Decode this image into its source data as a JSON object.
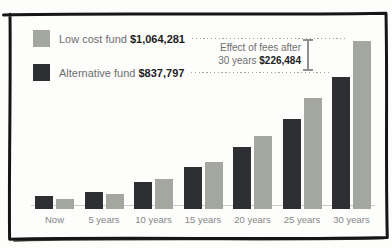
{
  "legend": {
    "low_cost": {
      "label": "Low cost fund",
      "value": "$1,064,281",
      "color": "#a4a7a0"
    },
    "alternative": {
      "label": "Alternative fund",
      "value": "$837,797",
      "color": "#2e2f32"
    }
  },
  "annotation": {
    "line1": "Effect of fees after",
    "line2_prefix": "30 years",
    "value": "$226,484"
  },
  "chart_data": {
    "type": "bar",
    "title": "",
    "xlabel": "",
    "ylabel": "",
    "grid": false,
    "legend_position": "top-left",
    "categories": [
      "Now",
      "5 years",
      "10 years",
      "15 years",
      "20 years",
      "25 years",
      "30 years"
    ],
    "series": [
      {
        "name": "Alternative fund",
        "color": "#2e2f32",
        "values": [
          82000,
          108000,
          171000,
          266000,
          393000,
          570000,
          837797
        ],
        "final_value_label": "$837,797"
      },
      {
        "name": "Low cost fund",
        "color": "#a4a7a0",
        "values": [
          63000,
          95000,
          190000,
          295000,
          462000,
          703000,
          1064281
        ],
        "final_value_label": "$1,064,281"
      }
    ],
    "ylim": [
      0,
      1064281
    ],
    "annotations": [
      {
        "text": "Effect of fees after 30 years $226,484",
        "value": 226484
      }
    ]
  }
}
